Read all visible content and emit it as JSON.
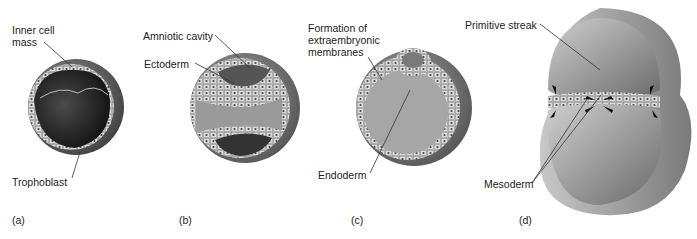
{
  "figure": {
    "panels": [
      {
        "id": "a",
        "panel_label": "(a)",
        "labels": {
          "inner_cell_mass_line1": "Inner cell",
          "inner_cell_mass_line2": "mass",
          "trophoblast": "Trophoblast"
        }
      },
      {
        "id": "b",
        "panel_label": "(b)",
        "labels": {
          "amniotic_cavity": "Amniotic cavity",
          "ectoderm": "Ectoderm"
        }
      },
      {
        "id": "c",
        "panel_label": "(c)",
        "labels": {
          "formation_line1": "Formation of",
          "formation_line2": "extraembryonic",
          "formation_line3": "membranes",
          "endoderm": "Endoderm"
        }
      },
      {
        "id": "d",
        "panel_label": "(d)",
        "labels": {
          "primitive_streak": "Primitive streak",
          "mesoderm": "Mesoderm"
        }
      }
    ],
    "colors": {
      "outer_shell": "#8a8a8a",
      "cell_layer": "#d6d6d6",
      "cavity_dark": "#2e2e2e",
      "leader_line": "#333333"
    }
  }
}
